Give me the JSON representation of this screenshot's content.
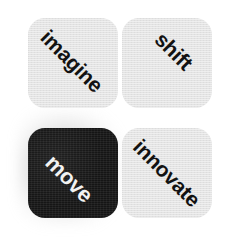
{
  "canvas": {
    "width": 234,
    "height": 238,
    "background_color": "#ffffff"
  },
  "palette": {
    "tile_light": "#e3e3e3",
    "tile_dark": "#151515",
    "text_on_light": "#121212",
    "text_on_dark": "#f2f2f2",
    "shadow": "#9a9a9a"
  },
  "grid": {
    "columns": 2,
    "rows": 2,
    "tiles": [
      {
        "id": "imagine",
        "label": "imagine",
        "position": "top-left",
        "fill": "light",
        "fill_color": "#e3e3e3",
        "text_color": "#121212",
        "text_rotation_deg": 45
      },
      {
        "id": "shift",
        "label": "shift",
        "position": "top-right",
        "fill": "light",
        "fill_color": "#e3e3e3",
        "text_color": "#121212",
        "text_rotation_deg": 45
      },
      {
        "id": "move",
        "label": "move",
        "position": "bottom-left",
        "fill": "dark",
        "fill_color": "#151515",
        "text_color": "#f2f2f2",
        "text_rotation_deg": 45,
        "has_shadow": true
      },
      {
        "id": "innovate",
        "label": "innovate",
        "position": "bottom-right",
        "fill": "light",
        "fill_color": "#e3e3e3",
        "text_color": "#121212",
        "text_rotation_deg": 45
      }
    ]
  }
}
